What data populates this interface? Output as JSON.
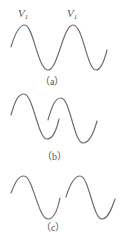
{
  "figure": {
    "panels": [
      {
        "id": "a",
        "caption": "（a）",
        "peak_labels": [
          {
            "main": "V",
            "sub": "1"
          },
          {
            "main": "V",
            "sub": "1"
          }
        ],
        "description": "single continuous wave with two crests"
      },
      {
        "id": "b",
        "caption": "（b）",
        "description": "two overlapping wave pulses"
      },
      {
        "id": "c",
        "caption": "（c）",
        "description": "two separated wave pulses"
      }
    ]
  }
}
